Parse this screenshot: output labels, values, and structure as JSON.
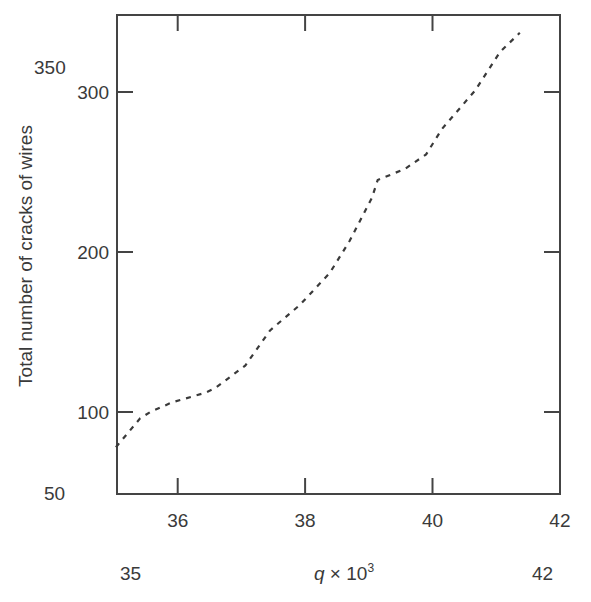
{
  "chart_data": {
    "type": "line",
    "title": "",
    "xlabel": "q × 10³",
    "xlabel_parts": {
      "var": "q",
      "times": " × 10",
      "exp": "3"
    },
    "ylabel": "Total number of cracks of wires",
    "xlim": [
      35,
      42
    ],
    "ylim": [
      50,
      350
    ],
    "grid": false,
    "legend": null,
    "x_ticks": [
      36,
      38,
      40,
      42
    ],
    "y_ticks": [
      100,
      200,
      300
    ],
    "extra_labels": {
      "x_min": "35",
      "x_max": "42",
      "y_min": "50",
      "y_max": "350"
    },
    "line_style": "dashed",
    "line_color": "#3a3a3a",
    "series": [
      {
        "name": "cracks",
        "x": [
          35.03,
          35.41,
          35.57,
          35.91,
          36.43,
          36.59,
          37.06,
          37.45,
          37.92,
          38.39,
          38.7,
          39.05,
          39.14,
          39.57,
          39.9,
          40.15,
          40.67,
          41.06,
          41.37
        ],
        "y": [
          78,
          96,
          100,
          106,
          112,
          115,
          129,
          151,
          167,
          187,
          207,
          234,
          245,
          252,
          261,
          277,
          301,
          325,
          337
        ]
      }
    ]
  }
}
